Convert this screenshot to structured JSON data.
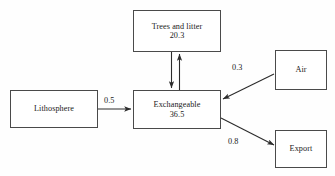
{
  "diagram": {
    "type": "box-and-arrow flow diagram",
    "nodes": [
      {
        "id": "trees",
        "label": "Trees and litter",
        "value": "20.3"
      },
      {
        "id": "lithosphere",
        "label": "Lithosphere",
        "value": ""
      },
      {
        "id": "exchangeable",
        "label": "Exchangeable",
        "value": "36.5"
      },
      {
        "id": "air",
        "label": "Air",
        "value": ""
      },
      {
        "id": "export",
        "label": "Export",
        "value": ""
      }
    ],
    "edges": [
      {
        "id": "lithosphere-exchangeable",
        "from": "lithosphere",
        "to": "exchangeable",
        "label": "0.5",
        "direction": "right"
      },
      {
        "id": "exchangeable-trees",
        "from": "exchangeable",
        "to": "trees",
        "label": "",
        "direction": "up"
      },
      {
        "id": "trees-exchangeable",
        "from": "trees",
        "to": "exchangeable",
        "label": "",
        "direction": "down"
      },
      {
        "id": "air-exchangeable",
        "from": "air",
        "to": "exchangeable",
        "label": "0.3",
        "direction": "down-left"
      },
      {
        "id": "exchangeable-export",
        "from": "exchangeable",
        "to": "export",
        "label": "0.8",
        "direction": "down-right"
      }
    ],
    "colors": {
      "background": "#fefefe",
      "box_border": "#4a4a4a",
      "arrow": "#2b2b2b",
      "text": "#1a1a1a"
    }
  }
}
